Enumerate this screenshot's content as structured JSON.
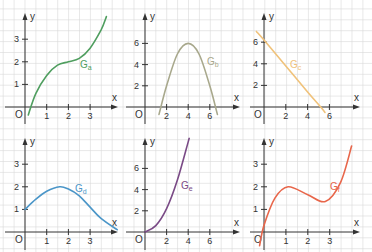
{
  "grid": {
    "color": "#d9d9d9",
    "spacing_px": 10.9
  },
  "panels": [
    {
      "id": "a",
      "label": "G",
      "sub": "a",
      "color": "#4f9e5f",
      "origin": [
        25,
        107
      ],
      "xscale": 21.7,
      "yscale": 22.6,
      "xticks": [
        {
          "v": 1,
          "t": "1"
        },
        {
          "v": 2,
          "t": "2"
        },
        {
          "v": 3,
          "t": "3"
        }
      ],
      "yticks": [
        {
          "v": 1,
          "t": "1"
        },
        {
          "v": 2,
          "t": "2"
        },
        {
          "v": 3,
          "t": "3"
        }
      ],
      "x_axis": [
        5,
        118
      ],
      "y_axis_top": 13,
      "y_axis_bottom": 124,
      "label_pos": [
        80,
        68
      ],
      "fn": "a",
      "domain": [
        0.15,
        3.75
      ]
    },
    {
      "id": "b",
      "label": "G",
      "sub": "b",
      "color": "#a8a88c",
      "origin": [
        145,
        107
      ],
      "xscale": 10.8,
      "yscale": 10.6,
      "xticks": [
        {
          "v": 2,
          "t": "2"
        },
        {
          "v": 4,
          "t": "4"
        },
        {
          "v": 6,
          "t": "6"
        }
      ],
      "yticks": [
        {
          "v": 2,
          "t": "2"
        },
        {
          "v": 4,
          "t": "4"
        },
        {
          "v": 6,
          "t": "6"
        }
      ],
      "x_axis": [
        126,
        240
      ],
      "y_axis_top": 13,
      "y_axis_bottom": 124,
      "label_pos": [
        207,
        65
      ],
      "fn": "b",
      "domain": [
        1.3,
        6.7
      ]
    },
    {
      "id": "c",
      "label": "G",
      "sub": "c",
      "color": "#f0c27a",
      "origin": [
        264,
        107
      ],
      "xscale": 10.9,
      "yscale": 10.8,
      "xticks": [
        {
          "v": 2,
          "t": "2"
        },
        {
          "v": 4,
          "t": "4"
        },
        {
          "v": 6,
          "t": "6"
        }
      ],
      "yticks": [
        {
          "v": 2,
          "t": "2"
        },
        {
          "v": 4,
          "t": "4"
        },
        {
          "v": 6,
          "t": "6"
        }
      ],
      "x_axis": [
        250,
        360
      ],
      "y_axis_top": 13,
      "y_axis_bottom": 124,
      "label_pos": [
        290,
        68
      ],
      "fn": "c",
      "domain": [
        -0.7,
        5.6
      ]
    },
    {
      "id": "d",
      "label": "G",
      "sub": "d",
      "color": "#4b96c8",
      "origin": [
        25,
        232
      ],
      "xscale": 21.7,
      "yscale": 22.6,
      "xticks": [
        {
          "v": 1,
          "t": "1"
        },
        {
          "v": 2,
          "t": "2"
        },
        {
          "v": 3,
          "t": "3"
        }
      ],
      "yticks": [
        {
          "v": 1,
          "t": "1"
        },
        {
          "v": 2,
          "t": "2"
        },
        {
          "v": 3,
          "t": "3"
        }
      ],
      "x_axis": [
        5,
        118
      ],
      "y_axis_top": 138,
      "y_axis_bottom": 250,
      "label_pos": [
        75,
        192
      ],
      "fn": "d",
      "domain": [
        0,
        4.25
      ]
    },
    {
      "id": "e",
      "label": "G",
      "sub": "e",
      "color": "#7a4a86",
      "origin": [
        145,
        232
      ],
      "xscale": 10.8,
      "yscale": 10.6,
      "xticks": [
        {
          "v": 2,
          "t": "2"
        },
        {
          "v": 4,
          "t": "4"
        },
        {
          "v": 6,
          "t": "6"
        }
      ],
      "yticks": [
        {
          "v": 2,
          "t": "2"
        },
        {
          "v": 4,
          "t": "4"
        },
        {
          "v": 6,
          "t": "6"
        }
      ],
      "x_axis": [
        126,
        240
      ],
      "y_axis_top": 138,
      "y_axis_bottom": 250,
      "label_pos": [
        181,
        189
      ],
      "fn": "e",
      "domain": [
        0,
        4.05
      ]
    },
    {
      "id": "f",
      "label": "G",
      "sub": "f",
      "color": "#e8664a",
      "origin": [
        264,
        232
      ],
      "xscale": 21.9,
      "yscale": 22.6,
      "xticks": [
        {
          "v": 1,
          "t": "1"
        },
        {
          "v": 2,
          "t": "2"
        },
        {
          "v": 3,
          "t": "3"
        }
      ],
      "yticks": [
        {
          "v": 1,
          "t": "1"
        },
        {
          "v": 2,
          "t": "2"
        },
        {
          "v": 3,
          "t": "3"
        }
      ],
      "x_axis": [
        250,
        360
      ],
      "y_axis_top": 138,
      "y_axis_bottom": 250,
      "label_pos": [
        330,
        190
      ],
      "fn": "f",
      "domain": [
        -0.2,
        4.0
      ]
    }
  ],
  "axis_labels": {
    "x": "x",
    "y": "y",
    "origin": "O"
  },
  "chart_data": [
    {
      "type": "line",
      "title": "G_a",
      "xlabel": "x",
      "ylabel": "y",
      "xticks": [
        1,
        2,
        3
      ],
      "yticks": [
        1,
        2,
        3
      ],
      "grid": true,
      "description": "cubic with inflection at (2,2), passes y≈-0.3 at x=0",
      "x": [
        0.15,
        0.5,
        1,
        1.5,
        2,
        2.5,
        3,
        3.5,
        3.75
      ],
      "y": [
        -0.35,
        0.6,
        1.4,
        1.85,
        2.0,
        2.15,
        2.6,
        3.4,
        4.0
      ]
    },
    {
      "type": "line",
      "title": "G_b",
      "xlabel": "x",
      "ylabel": "y",
      "xticks": [
        2,
        4,
        6
      ],
      "yticks": [
        2,
        4,
        6
      ],
      "grid": true,
      "description": "downward parabola, vertex (4,6), zeros ≈1.55 and 6.45",
      "x": [
        1.3,
        2,
        3,
        4,
        5,
        6,
        6.7
      ],
      "y": [
        -0.7,
        2.0,
        5.0,
        6.0,
        5.0,
        2.0,
        -0.7
      ]
    },
    {
      "type": "line",
      "title": "G_c",
      "xlabel": "x",
      "ylabel": "y",
      "xticks": [
        2,
        4,
        6
      ],
      "yticks": [
        2,
        4,
        6
      ],
      "grid": true,
      "description": "decreasing line, y-intercept ≈6.2, x-intercept ≈5.2",
      "x": [
        -0.7,
        0,
        2,
        4,
        5.2,
        5.6
      ],
      "y": [
        7.0,
        6.2,
        3.8,
        1.4,
        0,
        -0.5
      ]
    },
    {
      "type": "line",
      "title": "G_d",
      "xlabel": "x",
      "ylabel": "y",
      "xticks": [
        1,
        2,
        3
      ],
      "yticks": [
        1,
        2,
        3
      ],
      "grid": true,
      "description": "rises from (0,1) to max ≈(1.6,2), falls toward (4.2,0.1)",
      "x": [
        0,
        0.5,
        1,
        1.6,
        2,
        2.5,
        3,
        3.5,
        4.25
      ],
      "y": [
        1.0,
        1.45,
        1.8,
        2.0,
        1.9,
        1.6,
        1.1,
        0.6,
        0.1
      ]
    },
    {
      "type": "line",
      "title": "G_e",
      "xlabel": "x",
      "ylabel": "y",
      "xticks": [
        2,
        4,
        6
      ],
      "yticks": [
        2,
        4,
        6
      ],
      "grid": true,
      "description": "increasing convex from origin, reaches ≈8.5 at x=4",
      "x": [
        0,
        1,
        2,
        3,
        4,
        4.05
      ],
      "y": [
        0,
        0.6,
        2.2,
        4.9,
        8.5,
        8.7
      ]
    },
    {
      "type": "line",
      "title": "G_f",
      "xlabel": "x",
      "ylabel": "y",
      "xticks": [
        1,
        2,
        3
      ],
      "yticks": [
        1,
        2,
        3
      ],
      "grid": true,
      "description": "cubic, local max ≈(1.1,2), local min ≈(2.8,1.35)",
      "x": [
        -0.2,
        0,
        0.5,
        1.1,
        2,
        2.8,
        3.5,
        4.0
      ],
      "y": [
        -0.6,
        0.3,
        1.5,
        2.0,
        1.65,
        1.35,
        2.2,
        3.8
      ]
    }
  ]
}
